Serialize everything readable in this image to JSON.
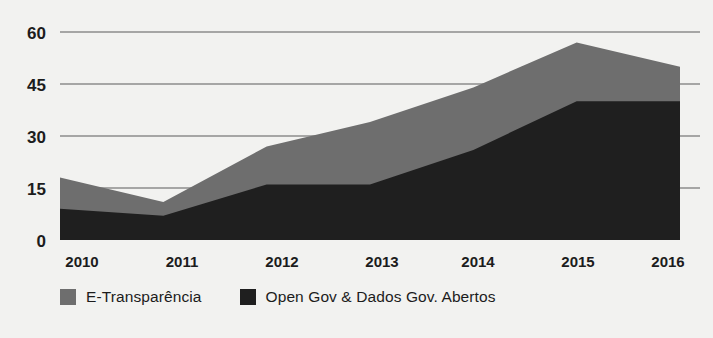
{
  "chart_data": {
    "type": "area",
    "stacked": true,
    "title": "",
    "subtitle": "",
    "xlabel": "",
    "ylabel": "",
    "categories": [
      "2010",
      "2011",
      "2012",
      "2013",
      "2014",
      "2015",
      "2016"
    ],
    "x": [
      2010,
      2011,
      2012,
      2013,
      2014,
      2015,
      2016
    ],
    "series": [
      {
        "name": "Open Gov & Dados Gov. Abertos",
        "color": "#1f1f1f",
        "values": [
          9,
          7,
          16,
          16,
          26,
          40,
          40
        ]
      },
      {
        "name": "E-Transparência",
        "color": "#6e6e6e",
        "values": [
          9,
          4,
          11,
          18,
          18,
          17,
          10
        ]
      }
    ],
    "totals": [
      18,
      11,
      27,
      34,
      44,
      57,
      50
    ],
    "ylim": [
      0,
      60
    ],
    "yticks": [
      0,
      15,
      30,
      45,
      60
    ],
    "ytick_labels": [
      "0",
      "15",
      "30",
      "45",
      "60"
    ],
    "xtick_labels": [
      "2010",
      "2011",
      "2012",
      "2013",
      "2014",
      "2015",
      "2016"
    ],
    "grid": true,
    "grid_color": "#8c8c8c",
    "legend_position": "bottom-left",
    "background": "#f2f2f0"
  },
  "legend": {
    "items": [
      {
        "label": "E-Transparência",
        "swatch_name": "legend-swatch-e-transparencia",
        "color": "#6e6e6e"
      },
      {
        "label": "Open Gov & Dados Gov. Abertos",
        "swatch_name": "legend-swatch-open-gov",
        "color": "#1f1f1f"
      }
    ]
  },
  "axes": {
    "y_ticks": [
      "60",
      "45",
      "30",
      "15",
      "0"
    ],
    "x_ticks": [
      "2010",
      "2011",
      "2012",
      "2013",
      "2014",
      "2015",
      "2016"
    ]
  }
}
